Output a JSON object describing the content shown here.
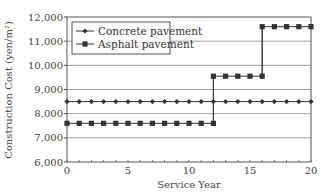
{
  "chart_data": {
    "type": "line",
    "title": "",
    "xlabel": "Service Year",
    "ylabel": "Construction Cost (yen/m²)",
    "xlim": [
      0,
      20
    ],
    "ylim": [
      6000,
      12000
    ],
    "x_ticks": [
      0,
      5,
      10,
      15,
      20
    ],
    "y_ticks": [
      6000,
      7000,
      8000,
      9000,
      10000,
      11000,
      12000
    ],
    "y_tick_labels": [
      "6,000",
      "7,000",
      "8,000",
      "9,000",
      "10,000",
      "11,000",
      "12,000"
    ],
    "grid": "horizontal",
    "legend_position": "upper left",
    "x": [
      0,
      1,
      2,
      3,
      4,
      5,
      6,
      7,
      8,
      9,
      10,
      11,
      12,
      13,
      14,
      15,
      16,
      17,
      18,
      19,
      20
    ],
    "series": [
      {
        "name": "Concrete pavement",
        "marker": "diamond",
        "values": [
          8500,
          8500,
          8500,
          8500,
          8500,
          8500,
          8500,
          8500,
          8500,
          8500,
          8500,
          8500,
          8500,
          8500,
          8500,
          8500,
          8500,
          8500,
          8500,
          8500,
          8500
        ]
      },
      {
        "name": "Asphalt pavement",
        "marker": "square",
        "step": true,
        "values": [
          7600,
          7600,
          7600,
          7600,
          7600,
          7600,
          7600,
          7600,
          7600,
          7600,
          7600,
          7600,
          7600,
          9550,
          9550,
          9550,
          9550,
          11600,
          11600,
          11600,
          11600
        ],
        "step_points": [
          {
            "x": 12,
            "from": 7600,
            "to": 9550
          },
          {
            "x": 16,
            "from": 9550,
            "to": 11600
          }
        ]
      }
    ],
    "colors": {
      "line": "#333333",
      "grid": "#888888",
      "frame": "#555555"
    }
  }
}
